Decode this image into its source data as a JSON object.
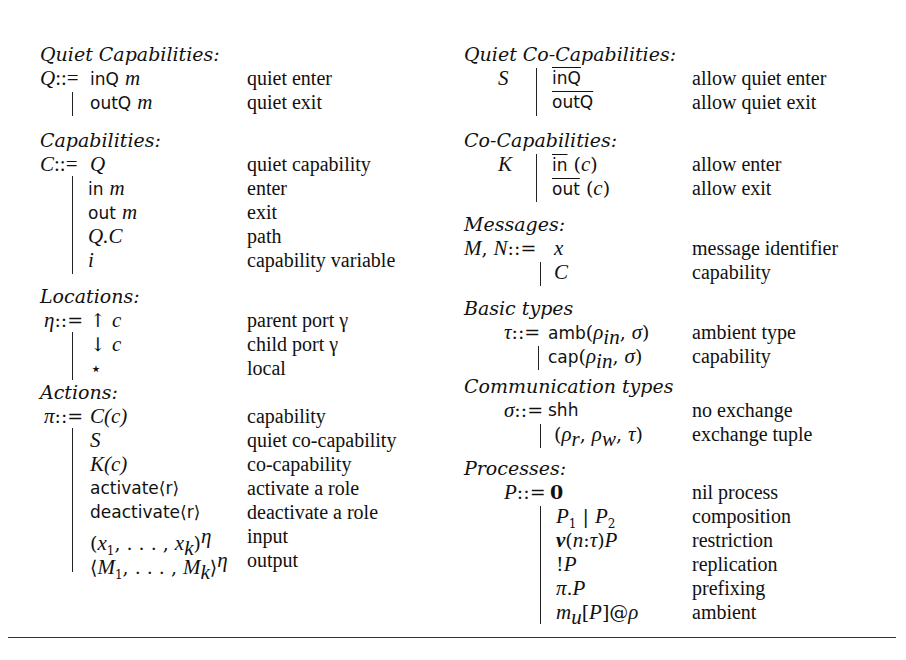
{
  "left_column": {
    "quiet_capabilities": {
      "heading": "Quiet Capabilities:",
      "lhs": "Q::=",
      "rows": [
        {
          "prod": "inQ m",
          "desc": "quiet enter"
        },
        {
          "prod": "outQ m",
          "desc": "quiet exit"
        }
      ]
    },
    "capabilities": {
      "heading": "Capabilities:",
      "lhs": "C::=",
      "rows": [
        {
          "prod": "Q",
          "desc": "quiet capability"
        },
        {
          "prod": "in m",
          "desc": "enter"
        },
        {
          "prod": "out m",
          "desc": "exit"
        },
        {
          "prod": "Q.C",
          "desc": "path"
        },
        {
          "prod": "i",
          "desc": "capability variable"
        }
      ]
    },
    "locations": {
      "heading": "Locations:",
      "lhs": "η::=",
      "rows": [
        {
          "prod": "↑ c",
          "desc": "parent port γ"
        },
        {
          "prod": "↓ c",
          "desc": "child port γ"
        },
        {
          "prod": "⋆",
          "desc": "local"
        }
      ]
    },
    "actions": {
      "heading": "Actions:",
      "lhs": "π::=",
      "rows": [
        {
          "prod": "C(c)",
          "desc": "capability"
        },
        {
          "prod": "S",
          "desc": "quiet co-capability"
        },
        {
          "prod": "K(c)",
          "desc": "co-capability"
        },
        {
          "prod": "activate⟨r⟩",
          "desc": "activate a role"
        },
        {
          "prod": "deactivate⟨r⟩",
          "desc": "deactivate a role"
        },
        {
          "prod": "(x₁, . . . , xₖ)^η",
          "desc": "input"
        },
        {
          "prod": "⟨M₁, . . . , Mₖ⟩^η",
          "desc": "output"
        }
      ]
    }
  },
  "right_column": {
    "quiet_co_capabilities": {
      "heading": "Quiet Co-Capabilities:",
      "lhs": "S",
      "rows": [
        {
          "prod": "inQ",
          "desc": "allow quiet enter"
        },
        {
          "prod": "outQ",
          "desc": "allow quiet exit"
        }
      ]
    },
    "co_capabilities": {
      "heading": "Co-Capabilities:",
      "lhs": "K",
      "rows": [
        {
          "prod": "in (c)",
          "desc": "allow enter"
        },
        {
          "prod": "out (c)",
          "desc": "allow exit"
        }
      ]
    },
    "messages": {
      "heading": "Messages:",
      "lhs": "M, N::=",
      "rows": [
        {
          "prod": "x",
          "desc": "message identifier"
        },
        {
          "prod": "C",
          "desc": "capability"
        }
      ]
    },
    "basic_types": {
      "heading": "Basic types",
      "lhs": "τ::=",
      "rows": [
        {
          "prod": "amb(ρin, σ)",
          "desc": "ambient type"
        },
        {
          "prod": "cap(ρin, σ)",
          "desc": "capability"
        }
      ]
    },
    "communication_types": {
      "heading": "Communication types",
      "lhs": "σ::=",
      "rows": [
        {
          "prod": "shh",
          "desc": "no exchange"
        },
        {
          "prod": "(ρr, ρw, τ)",
          "desc": "exchange tuple"
        }
      ]
    },
    "processes": {
      "heading": "Processes:",
      "lhs": "P::=",
      "rows": [
        {
          "prod": "0",
          "desc": "nil process"
        },
        {
          "prod": "P₁ | P₂",
          "desc": "composition"
        },
        {
          "prod": "ν(n:τ)P",
          "desc": "restriction"
        },
        {
          "prod": "!P",
          "desc": "replication"
        },
        {
          "prod": "π.P",
          "desc": "prefixing"
        },
        {
          "prod": "mᵤ[P]@ρ",
          "desc": "ambient"
        }
      ]
    }
  }
}
